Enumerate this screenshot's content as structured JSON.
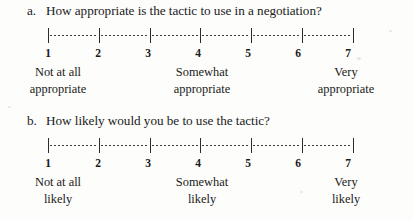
{
  "questions": [
    {
      "label": "a.",
      "text": "How appropriate is the tactic to use in a negotiation?",
      "scale": {
        "points": [
          "1",
          "2",
          "3",
          "4",
          "5",
          "6",
          "7"
        ],
        "anchors": {
          "low_line1": "Not at all",
          "low_line2": "appropriate",
          "mid_line1": "Somewhat",
          "mid_line2": "appropriate",
          "high_line1": "Very",
          "high_line2": "appropriate"
        }
      }
    },
    {
      "label": "b.",
      "text": "How likely would you be to use the tactic?",
      "scale": {
        "points": [
          "1",
          "2",
          "3",
          "4",
          "5",
          "6",
          "7"
        ],
        "anchors": {
          "low_line1": "Not at all",
          "low_line2": "likely",
          "mid_line1": "Somewhat",
          "mid_line2": "likely",
          "high_line1": "Very",
          "high_line2": "likely"
        }
      }
    }
  ],
  "colors": {
    "ink": "#1a1a1a",
    "rule": "#2b2b2b",
    "paper": "#fdfdfb"
  }
}
